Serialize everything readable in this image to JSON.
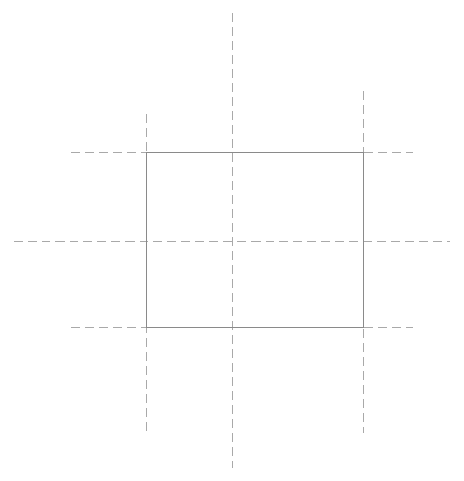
{
  "canvas": {
    "width": 464,
    "height": 481,
    "background_color": "#ffffff",
    "title": "Rectangle with centerlines"
  },
  "style": {
    "solid_stroke_color": "#8a8a8a",
    "solid_stroke_width": 1,
    "dashed_stroke_color": "#a9a9a9",
    "dashed_stroke_width": 1.1,
    "dash_pattern": "9 5",
    "dash_pattern_short": "8 5"
  },
  "chart_data": {
    "type": "scatter",
    "xlabel": "",
    "ylabel": "",
    "xlim": [
      0,
      464
    ],
    "ylim": [
      0,
      481
    ],
    "grid": false,
    "legend": null,
    "annotations": [],
    "shapes": [
      {
        "name": "main-rectangle",
        "kind": "rect",
        "linestyle": "solid",
        "x": 146,
        "y": 152,
        "width": 217,
        "height": 175,
        "left": 146,
        "right": 363,
        "top": 152,
        "bottom": 327
      },
      {
        "name": "vertical-centerline-middle",
        "kind": "line",
        "linestyle": "dashed",
        "x1": 232,
        "y1": 12,
        "x2": 232,
        "y2": 467
      },
      {
        "name": "vertical-extension-left",
        "kind": "line",
        "linestyle": "dashed",
        "x1": 146,
        "y1": 113,
        "x2": 146,
        "y2": 430
      },
      {
        "name": "vertical-extension-right",
        "kind": "line",
        "linestyle": "dashed",
        "x1": 363,
        "y1": 90,
        "x2": 363,
        "y2": 432
      },
      {
        "name": "horizontal-centerline-middle",
        "kind": "line",
        "linestyle": "dashed",
        "x1": 13,
        "y1": 241,
        "x2": 450,
        "y2": 241
      },
      {
        "name": "horizontal-extension-top-left",
        "kind": "line",
        "linestyle": "dashed",
        "x1": 70,
        "y1": 152,
        "x2": 146,
        "y2": 152
      },
      {
        "name": "horizontal-extension-top-right",
        "kind": "line",
        "linestyle": "dashed",
        "x1": 363,
        "y1": 152,
        "x2": 412,
        "y2": 152
      },
      {
        "name": "horizontal-extension-bottom-left",
        "kind": "line",
        "linestyle": "dashed",
        "x1": 70,
        "y1": 327,
        "x2": 146,
        "y2": 327
      },
      {
        "name": "horizontal-extension-bottom-right",
        "kind": "line",
        "linestyle": "dashed",
        "x1": 363,
        "y1": 327,
        "x2": 412,
        "y2": 327
      }
    ],
    "intersection_points": [
      {
        "name": "rect-top-left",
        "x": 146,
        "y": 152
      },
      {
        "name": "rect-top-right",
        "x": 363,
        "y": 152
      },
      {
        "name": "rect-bottom-left",
        "x": 146,
        "y": 327
      },
      {
        "name": "rect-bottom-right",
        "x": 363,
        "y": 327
      },
      {
        "name": "center",
        "x": 232,
        "y": 241
      }
    ]
  }
}
